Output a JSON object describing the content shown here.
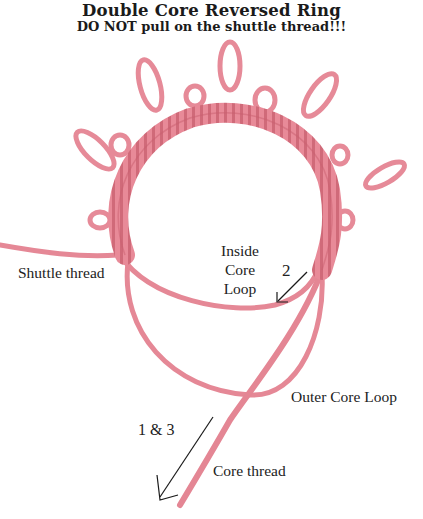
{
  "title": "Double Core Reversed Ring",
  "subtitle": "DO NOT pull on the shuttle thread!!!",
  "labels": {
    "shuttle_thread": "Shuttle thread",
    "inside_core_loop": [
      "Inside",
      "Core",
      "Loop"
    ],
    "step_2": "2",
    "outer_core_loop": "Outer Core Loop",
    "step_1_3": "1 & 3",
    "core_thread": "Core thread"
  },
  "colors": {
    "thread": "#e88a98",
    "thread_shadow": "#c9606f",
    "arrow": "#1a1a1a",
    "text": "#222222"
  }
}
